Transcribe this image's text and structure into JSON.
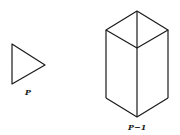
{
  "figures": [
    {
      "id": "triangle",
      "label": "P",
      "shape": "triangle",
      "vertices": [
        [
          12,
          44
        ],
        [
          12,
          84
        ],
        [
          45,
          65
        ]
      ]
    },
    {
      "id": "prism",
      "label": "P−1",
      "shape": "square-prism",
      "vertices": {
        "top": [
          137,
          11
        ],
        "left": [
          106,
          30
        ],
        "right": [
          168,
          30
        ],
        "front": [
          137,
          48
        ],
        "bottom_left": [
          106,
          98
        ],
        "bottom_front": [
          137,
          117
        ],
        "bottom_right": [
          168,
          98
        ]
      }
    }
  ],
  "colors": {
    "stroke": "#1a1a1a",
    "background": "#ffffff"
  }
}
